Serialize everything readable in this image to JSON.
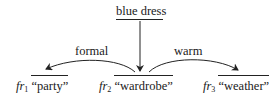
{
  "source_node": {
    "label": "blue dress"
  },
  "edges": [
    {
      "label": "formal",
      "from": "wardrobe",
      "to": "party"
    },
    {
      "label": "warm",
      "from": "wardrobe",
      "to": "weather"
    }
  ],
  "frames": [
    {
      "prefix": "fr",
      "index": "1",
      "word": "“party”"
    },
    {
      "prefix": "fr",
      "index": "2",
      "word": "“wardrobe”"
    },
    {
      "prefix": "fr",
      "index": "3",
      "word": "“weather”"
    }
  ]
}
